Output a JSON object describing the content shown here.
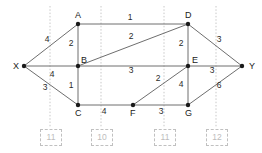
{
  "diagram": {
    "nodes": [
      {
        "id": "X",
        "label": "X",
        "x": 24,
        "y": 66
      },
      {
        "id": "A",
        "label": "A",
        "x": 78,
        "y": 24
      },
      {
        "id": "B",
        "label": "B",
        "x": 78,
        "y": 66
      },
      {
        "id": "C",
        "label": "C",
        "x": 78,
        "y": 105
      },
      {
        "id": "D",
        "label": "D",
        "x": 188,
        "y": 24
      },
      {
        "id": "E",
        "label": "E",
        "x": 188,
        "y": 66
      },
      {
        "id": "F",
        "label": "F",
        "x": 133,
        "y": 105
      },
      {
        "id": "G",
        "label": "G",
        "x": 188,
        "y": 105
      },
      {
        "id": "Y",
        "label": "Y",
        "x": 242,
        "y": 66
      }
    ],
    "edges": [
      {
        "from": "X",
        "to": "A",
        "weight": "4",
        "lx": 47,
        "ly": 42
      },
      {
        "from": "X",
        "to": "B",
        "weight": "4",
        "lx": 52,
        "ly": 77
      },
      {
        "from": "X",
        "to": "C",
        "weight": "3",
        "lx": 45,
        "ly": 90
      },
      {
        "from": "A",
        "to": "B",
        "weight": "2",
        "lx": 71,
        "ly": 46
      },
      {
        "from": "A",
        "to": "D",
        "weight": "1",
        "lx": 130,
        "ly": 20
      },
      {
        "from": "B",
        "to": "D",
        "weight": "2",
        "lx": 131,
        "ly": 39
      },
      {
        "from": "B",
        "to": "E",
        "weight": "3",
        "lx": 131,
        "ly": 73
      },
      {
        "from": "B",
        "to": "C",
        "weight": "1",
        "lx": 71,
        "ly": 88
      },
      {
        "from": "C",
        "to": "F",
        "weight": "4",
        "lx": 104,
        "ly": 114
      },
      {
        "from": "F",
        "to": "G",
        "weight": "3",
        "lx": 161,
        "ly": 114
      },
      {
        "from": "F",
        "to": "E",
        "weight": "2",
        "lx": 158,
        "ly": 81
      },
      {
        "from": "D",
        "to": "E",
        "weight": "2",
        "lx": 181,
        "ly": 46
      },
      {
        "from": "D",
        "to": "Y",
        "weight": "3",
        "lx": 219,
        "ly": 42
      },
      {
        "from": "E",
        "to": "G",
        "weight": "4",
        "lx": 181,
        "ly": 87
      },
      {
        "from": "E",
        "to": "Y",
        "weight": "3",
        "lx": 212,
        "ly": 73
      },
      {
        "from": "G",
        "to": "Y",
        "weight": "6",
        "lx": 219,
        "ly": 88
      }
    ],
    "cuts": [
      {
        "value": "11",
        "x": 50,
        "boxLeft": 40,
        "boxTop": 129
      },
      {
        "value": "10",
        "x": 101,
        "boxLeft": 91,
        "boxTop": 129
      },
      {
        "value": "11",
        "x": 164,
        "boxLeft": 154,
        "boxTop": 129
      },
      {
        "value": "12",
        "x": 216,
        "boxLeft": 206,
        "boxTop": 129
      }
    ],
    "colors": {
      "edge": "#6e6e6e",
      "node": "#1a1a1a",
      "cut": "#c0c0c0",
      "background": "#ffffff"
    }
  }
}
